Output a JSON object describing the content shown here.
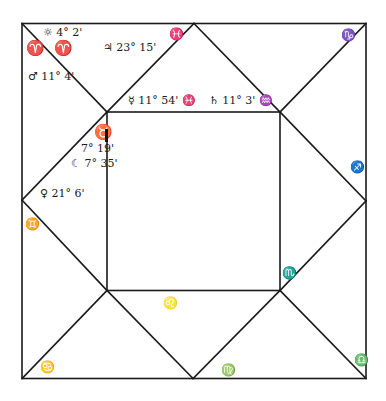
{
  "chart": {
    "style": "house-diagram",
    "line_color": "#1a1a1a",
    "background": "#ffffff",
    "ascendant_marker": "vertical-bar-next-to-taurus"
  },
  "signs": {
    "aries_a": "♈",
    "aries_b": "♈",
    "pisces": "♓",
    "capricorn": "♑",
    "taurus": "♉",
    "gemini": "♊",
    "sagittarius": "♐",
    "scorpio": "♏",
    "cancer": "♋",
    "leo": "♌",
    "virgo": "♍",
    "libra": "♎"
  },
  "planets": {
    "sun": {
      "glyph": "☼",
      "text": "☼ 4° 2'"
    },
    "mars": {
      "glyph": "♂",
      "text": "♂ 11° 4'"
    },
    "jupiter": {
      "glyph": "♃",
      "text": "♃ 23° 15'"
    },
    "mercury": {
      "glyph": "☿",
      "text": "☿ 11° 54' ♓"
    },
    "saturn": {
      "glyph": "♄",
      "text": "♄ 11° 3' ♒"
    },
    "asc_degree": {
      "text": "7° 19'"
    },
    "moon": {
      "glyph": "☾",
      "text": "☾ 7° 35'"
    },
    "venus": {
      "glyph": "♀",
      "text": "♀ 21° 6'"
    }
  }
}
